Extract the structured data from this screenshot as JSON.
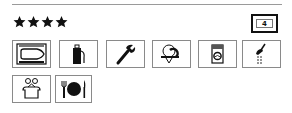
{
  "rating": {
    "stars": 4,
    "max_shown": 4
  },
  "badge": {
    "value": "4"
  },
  "facilities": [
    {
      "icon": "boat-harbour-icon",
      "label": "Marina / boat berth"
    },
    {
      "icon": "fuel-pump-icon",
      "label": "Fuel"
    },
    {
      "icon": "wrench-icon",
      "label": "Repairs"
    },
    {
      "icon": "water-tap-icon",
      "label": "Water"
    },
    {
      "icon": "washing-machine-icon",
      "label": "Laundry"
    },
    {
      "icon": "shower-icon",
      "label": "Showers"
    },
    {
      "icon": "provisions-shop-icon",
      "label": "Provisions"
    },
    {
      "icon": "restaurant-icon",
      "label": "Restaurant"
    }
  ],
  "colors": {
    "ink": "#111111",
    "border": "#8a8a8a",
    "rule": "#9a9a9a"
  }
}
